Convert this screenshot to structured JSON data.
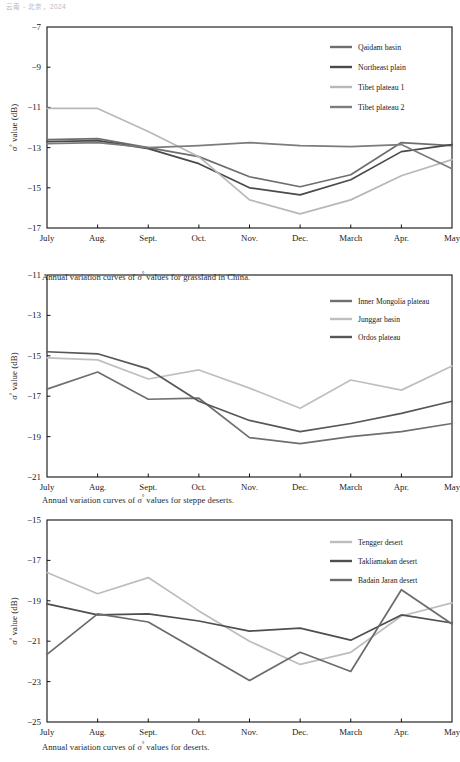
{
  "running_head": "云南 - 北京，2024",
  "figures": [
    {
      "id": "grassland",
      "caption_prefix": "Annual variation curves of ",
      "caption_symbol": "σ",
      "caption_suffix": " values for grassland in China.",
      "ylabel_symbol": "σ",
      "ylabel_text": " value (dB)",
      "chart_data": {
        "type": "line",
        "title": "Annual variation curves of σ° values for grassland in China.",
        "xlabel": "",
        "ylabel": "σ° value (dB)",
        "categories": [
          "July",
          "Aug.",
          "Sept.",
          "Oct.",
          "Nov.",
          "Dec.",
          "March",
          "Apr.",
          "May"
        ],
        "ylim": [
          -17,
          -7
        ],
        "yticks": [
          -7,
          -9,
          -11,
          -13,
          -15,
          -17
        ],
        "grid": false,
        "legend_position": "top-right",
        "series": [
          {
            "name": "Qaidam basin",
            "color": "#6e6e6e",
            "values": [
              -12.6,
              -12.55,
              -13.0,
              -13.45,
              -14.45,
              -14.95,
              -14.35,
              -12.75,
              -12.9
            ]
          },
          {
            "name": "Northeast plain",
            "color": "#4a4a4a",
            "values": [
              -12.7,
              -12.65,
              -13.05,
              -13.8,
              -15.0,
              -15.35,
              -14.6,
              -13.2,
              -12.85
            ]
          },
          {
            "name": "Tibet plateau 1",
            "color": "#b8b8b8",
            "values": [
              -11.05,
              -11.05,
              -12.2,
              -13.45,
              -15.6,
              -16.3,
              -15.6,
              -14.4,
              -13.6
            ]
          },
          {
            "name": "Tibet  plateau 2",
            "color": "#7c7c7c",
            "values": [
              -12.8,
              -12.75,
              -13.0,
              -12.9,
              -12.75,
              -12.9,
              -12.95,
              -12.85,
              -14.05
            ]
          }
        ]
      }
    },
    {
      "id": "steppe",
      "caption_prefix": "Annual variation curves of ",
      "caption_symbol": "σ",
      "caption_suffix": " values for steppe deserts.",
      "ylabel_symbol": "σ",
      "ylabel_text": " value (dB)",
      "chart_data": {
        "type": "line",
        "title": "Annual variation curves of σ° values for steppe deserts.",
        "xlabel": "",
        "ylabel": "σ° value (dB)",
        "categories": [
          "July",
          "Aug.",
          "Sept.",
          "Oct.",
          "Nov.",
          "Dec.",
          "March",
          "Apr.",
          "May"
        ],
        "ylim": [
          -21,
          -11
        ],
        "yticks": [
          -11,
          -13,
          -15,
          -17,
          -19,
          -21
        ],
        "grid": false,
        "legend_position": "top-right",
        "series": [
          {
            "name": "Inner Mongolia plateau",
            "color": "#6f6f6f",
            "values": [
              -16.65,
              -15.8,
              -17.15,
              -17.1,
              -19.05,
              -19.35,
              -19.0,
              -18.75,
              -18.35
            ]
          },
          {
            "name": "Junggar basin",
            "color": "#bfbfbf",
            "values": [
              -15.1,
              -15.2,
              -16.15,
              -15.7,
              -16.6,
              -17.6,
              -16.2,
              -16.7,
              -15.5
            ]
          },
          {
            "name": "Ordos plateau",
            "color": "#575757",
            "values": [
              -14.8,
              -14.9,
              -15.65,
              -17.25,
              -18.2,
              -18.75,
              -18.35,
              -17.85,
              -17.25
            ]
          }
        ]
      }
    },
    {
      "id": "deserts",
      "caption_prefix": "Annual variation curves of ",
      "caption_symbol": "σ",
      "caption_suffix": " values for deserts.",
      "ylabel_symbol": "σ",
      "ylabel_text": " value (dB)",
      "chart_data": {
        "type": "line",
        "title": "Annual variation curves of σ° values for deserts.",
        "xlabel": "",
        "ylabel": "σ° value (dB)",
        "categories": [
          "July",
          "Aug.",
          "Sept.",
          "Oct.",
          "Nov.",
          "Dec.",
          "March",
          "Apr.",
          "May"
        ],
        "ylim": [
          -25,
          -15
        ],
        "yticks": [
          -15,
          -17,
          -19,
          -21,
          -23,
          -25
        ],
        "grid": false,
        "legend_position": "top-right",
        "series": [
          {
            "name": "Tengger desert",
            "color": "#bdbdbd",
            "values": [
              -17.6,
              -18.65,
              -17.85,
              -19.5,
              -21.0,
              -22.15,
              -21.55,
              -19.75,
              -19.1
            ]
          },
          {
            "name": "Takliamakan desert",
            "color": "#4f4f4f",
            "values": [
              -19.15,
              -19.7,
              -19.65,
              -20.0,
              -20.5,
              -20.35,
              -20.95,
              -19.7,
              -20.1
            ]
          },
          {
            "name": "Badain Jaran desert",
            "color": "#6b6b6b",
            "values": [
              -21.65,
              -19.65,
              -20.05,
              -21.5,
              -22.95,
              -21.55,
              -22.5,
              -18.45,
              -20.15
            ]
          }
        ]
      }
    }
  ]
}
